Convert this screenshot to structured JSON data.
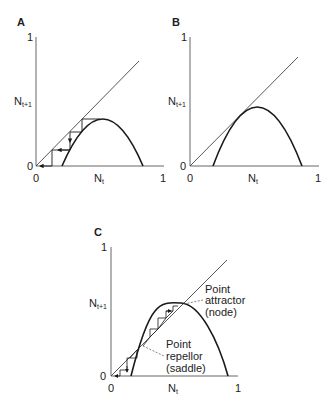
{
  "figure": {
    "panels": [
      {
        "id": "A",
        "label": "A",
        "y_tick_top": "1",
        "y_tick_zero": "0",
        "x_tick_zero": "0",
        "x_tick_one": "1",
        "y_label_main": "N",
        "y_label_sub": "t+1",
        "x_label_main": "N",
        "x_label_sub": "t",
        "description": "Hump curve below diagonal; cobweb iteration declines to 0"
      },
      {
        "id": "B",
        "label": "B",
        "y_tick_top": "1",
        "y_tick_zero": "0",
        "x_tick_zero": "0",
        "x_tick_one": "1",
        "y_label_main": "N",
        "y_label_sub": "t+1",
        "x_label_main": "N",
        "x_label_sub": "t",
        "description": "Hump curve tangent to diagonal"
      },
      {
        "id": "C",
        "label": "C",
        "y_tick_top": "1",
        "y_tick_zero": "0",
        "x_tick_zero": "0",
        "x_tick_one": "1",
        "y_label_main": "N",
        "y_label_sub": "t+1",
        "x_label_main": "N",
        "x_label_sub": "t",
        "annotations": {
          "attractor": [
            "Point",
            "attractor",
            "(node)"
          ],
          "repellor": [
            "Point",
            "repellor",
            "(saddle)"
          ]
        },
        "description": "Hump curve crosses diagonal twice; cobweb converges up to attractor and down to 0 from repellor"
      }
    ],
    "colors": {
      "curve": "#1a1a1a",
      "diagonal": "#444444",
      "axis": "#555555",
      "annotation_leader": "#666666"
    }
  }
}
